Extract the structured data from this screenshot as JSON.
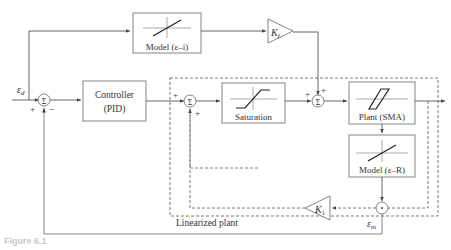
{
  "diagram": {
    "type": "block-diagram",
    "blocks": {
      "model_ei": "Model (ε–i)",
      "controller_line1": "Controller",
      "controller_line2": "(PID)",
      "saturation": "Saturation",
      "plant": "Plant (SMA)",
      "model_er": "Model (ε–R)",
      "kf": "K",
      "kf_sub": "f",
      "k1": "K",
      "k1_sub": "1"
    },
    "signals": {
      "input": "ε",
      "input_sub": "d",
      "measured": "ε",
      "measured_sub": "m"
    },
    "summing_symbol": "Σ",
    "signs": {
      "sum1_plus": "+",
      "sum1_minus": "−",
      "sum2_plus_left": "+",
      "sum2_plus_bottom": "+",
      "sum3_plus_left": "+",
      "sum3_plus_top": "+"
    },
    "region_label": "Linearized plant",
    "caption": "Figure 6.1"
  }
}
